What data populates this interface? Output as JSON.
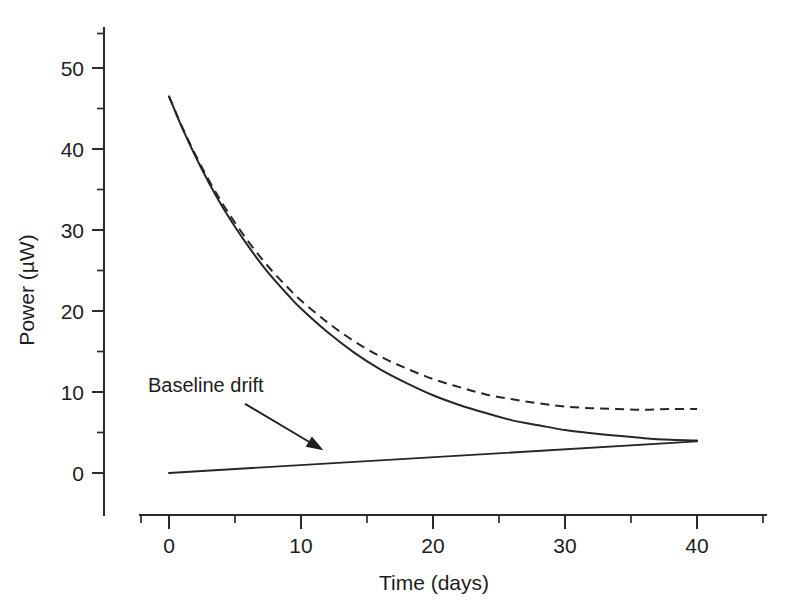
{
  "chart_data": {
    "type": "line",
    "title": "",
    "xlabel": "Time (days)",
    "ylabel": "Power (µW)",
    "xlim": [
      -2.2,
      45.2
    ],
    "ylim": [
      -5.2,
      55.5
    ],
    "xticks": [
      0,
      10,
      20,
      30,
      40
    ],
    "xtick_labels": [
      "0",
      "10",
      "20",
      "30",
      "40"
    ],
    "xminor_ticks": [
      5,
      15,
      25,
      35,
      45
    ],
    "yticks": [
      0,
      10,
      20,
      30,
      40,
      50
    ],
    "ytick_labels": [
      "0",
      "10",
      "20",
      "30",
      "40",
      "50"
    ],
    "yminor_ticks": [
      5,
      15,
      25,
      35,
      45,
      55
    ],
    "grid": false,
    "legend": null,
    "tick_direction": "out",
    "spines": [
      "left",
      "bottom"
    ],
    "series": [
      {
        "name": "heat-output-decay",
        "style": "solid",
        "color": "#262626",
        "x": [
          0,
          1,
          2,
          3,
          4,
          5,
          6,
          7,
          8,
          9,
          10,
          12,
          14,
          16,
          18,
          20,
          22,
          24,
          26,
          28,
          30,
          32,
          34,
          36,
          38,
          40
        ],
        "y": [
          46.5,
          42.6,
          39.1,
          35.9,
          33.0,
          30.4,
          28.0,
          25.8,
          23.8,
          22.0,
          20.3,
          17.4,
          14.9,
          12.8,
          11.1,
          9.6,
          8.4,
          7.4,
          6.5,
          5.9,
          5.3,
          4.9,
          4.6,
          4.3,
          4.1,
          4.0
        ]
      },
      {
        "name": "measured-signal-with-drift",
        "style": "dashed",
        "color": "#262626",
        "x": [
          0,
          1,
          2,
          3,
          4,
          5,
          6,
          7,
          8,
          9,
          10,
          12,
          14,
          16,
          18,
          20,
          22,
          24,
          26,
          28,
          30,
          32,
          34,
          36,
          38,
          40
        ],
        "y": [
          46.5,
          42.7,
          39.3,
          36.2,
          33.4,
          30.9,
          28.6,
          26.5,
          24.6,
          22.9,
          21.3,
          18.6,
          16.3,
          14.4,
          12.9,
          11.6,
          10.6,
          9.7,
          9.1,
          8.6,
          8.2,
          8.0,
          7.9,
          7.8,
          7.9,
          7.9
        ]
      },
      {
        "name": "baseline-drift",
        "style": "solid",
        "color": "#262626",
        "x": [
          0,
          40
        ],
        "y": [
          0.0,
          3.9
        ]
      }
    ],
    "annotations": [
      {
        "name": "baseline-drift-annotation",
        "text": "Baseline drift",
        "text_x": 0.0,
        "text_y": 11.0,
        "arrow_from_x": 5.8,
        "arrow_from_y": 8.5,
        "arrow_to_x": 11.7,
        "arrow_to_y": 2.8
      }
    ]
  },
  "figure": {
    "background": "#ffffff",
    "ink_color": "#262626"
  }
}
